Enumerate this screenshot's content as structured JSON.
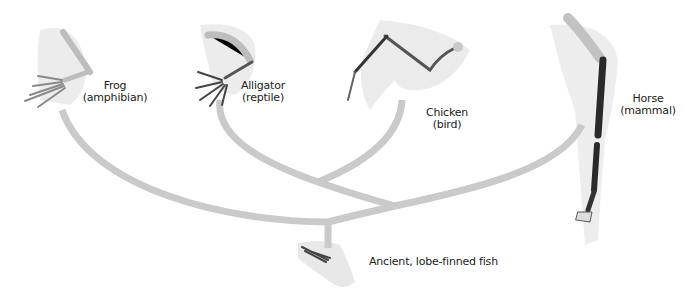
{
  "diagram": {
    "branch_color": "#c9c9c9",
    "halo_color": "#e2e2e2",
    "bone_color": "#cfcfcf",
    "bone_dark": "#2a2a2a",
    "taxa": [
      {
        "id": "frog",
        "name": "Frog",
        "group": "(amphibian)"
      },
      {
        "id": "alligator",
        "name": "Alligator",
        "group": "(reptile)"
      },
      {
        "id": "chicken",
        "name": "Chicken",
        "group": "(bird)"
      },
      {
        "id": "horse",
        "name": "Horse",
        "group": "(mammal)"
      }
    ],
    "ancestor": {
      "id": "fish",
      "name": "Ancient, lobe-finned fish"
    }
  }
}
